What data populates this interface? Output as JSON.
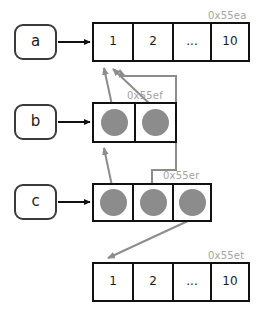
{
  "diagram": {
    "colors": {
      "background": "#ffffff",
      "box_border": "#3a3a3a",
      "array_border": "#111111",
      "pointer_blob": "#8c8c8c",
      "black_arrow": "#111111",
      "gray_arrow": "#8c8c8c",
      "address_label": "#a3a3a3",
      "text": "#1a1a1a"
    },
    "variables": [
      {
        "name": "variable-a",
        "label": "a"
      },
      {
        "name": "variable-b",
        "label": "b"
      },
      {
        "name": "variable-c",
        "label": "c"
      }
    ],
    "arrays": [
      {
        "name": "array-top",
        "address": "0x55ea",
        "kind": "values",
        "cells": [
          "1",
          "2",
          "...",
          "10"
        ]
      },
      {
        "name": "array-b",
        "address": "0x55ef",
        "kind": "pointers",
        "cells": [
          "pointer",
          "pointer"
        ]
      },
      {
        "name": "array-c",
        "address": "0x55er",
        "kind": "pointers",
        "cells": [
          "pointer",
          "pointer",
          "pointer"
        ]
      },
      {
        "name": "array-bottom",
        "address": "0x55et",
        "kind": "values",
        "cells": [
          "1",
          "2",
          "...",
          "10"
        ]
      }
    ]
  }
}
